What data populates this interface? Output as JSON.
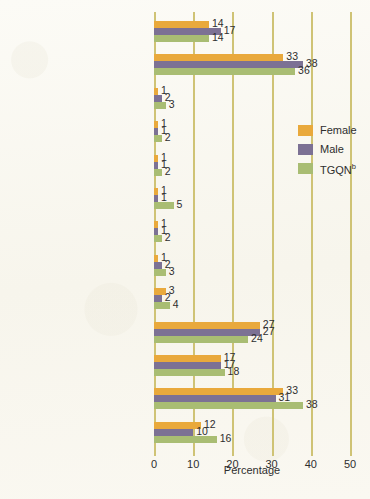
{
  "chart_data": {
    "type": "bar",
    "orientation": "horizontal",
    "title": "",
    "xlabel": "Percentage",
    "ylabel": "",
    "xlim": [
      0,
      50
    ],
    "xticks": [
      0,
      10,
      20,
      30,
      40,
      50
    ],
    "grid": true,
    "legend_position": "right",
    "categories": [
      "Someone I was involved or intimate with at the time",
      "Someone I previously had been involved on intimate with",
      "Teacher",
      "Advisor",
      "Someone I was teaching or advising",
      "Live-in residential staff",
      "Coach or trainer",
      "Boss or supervisor",
      "Co-worker",
      "Friend",
      "Classmate",
      "Someone I know or recognize, but was not a friend",
      "Did not know or recognize this person"
    ],
    "category_lines": [
      [
        "Someone I was involved or",
        "intimate with at the time",
        "a"
      ],
      [
        "Someone I previously had",
        "been involved on intimate with",
        ""
      ],
      [
        "Teacher",
        "",
        ""
      ],
      [
        "Advisor",
        "",
        ""
      ],
      [
        "Someone I was teaching",
        "or advising",
        ""
      ],
      [
        "Live-in residential staff",
        "",
        ""
      ],
      [
        "Coach or trainer",
        "",
        ""
      ],
      [
        "Boss or supervisor",
        "",
        ""
      ],
      [
        "Co-worker",
        "",
        ""
      ],
      [
        "Friend",
        "",
        ""
      ],
      [
        "Classmate",
        "",
        ""
      ],
      [
        "Someone I know or recognize,",
        "but was not a friend",
        ""
      ],
      [
        "Did not know or",
        "recognize this person",
        ""
      ]
    ],
    "series": [
      {
        "name": "Female",
        "color": "#e9a93c",
        "values": [
          14,
          33,
          1,
          1,
          1,
          1,
          1,
          1,
          3,
          27,
          17,
          33,
          12
        ]
      },
      {
        "name": "Male",
        "color": "#7c7194",
        "values": [
          17,
          38,
          2,
          1,
          1,
          1,
          1,
          2,
          2,
          27,
          17,
          31,
          10
        ]
      },
      {
        "name": "TGQN",
        "color": "#a9bd73",
        "values": [
          14,
          36,
          3,
          2,
          2,
          5,
          2,
          3,
          4,
          24,
          18,
          38,
          16
        ]
      }
    ]
  },
  "legend": {
    "items": [
      {
        "label": "Female",
        "sup": "",
        "color": "#e9a93c",
        "key": "female"
      },
      {
        "label": "Male",
        "sup": "",
        "color": "#7c7194",
        "key": "male"
      },
      {
        "label": "TGQN",
        "sup": "b",
        "color": "#a9bd73",
        "key": "tgqn"
      }
    ]
  },
  "axis": {
    "title": "Percentage",
    "tick_labels": [
      "0",
      "10",
      "20",
      "30",
      "40",
      "50"
    ]
  },
  "colors": {
    "female": "#e9a93c",
    "male": "#7c7194",
    "tgqn": "#a9bd73",
    "gridline": "#cfc375",
    "background": "#fbfaf5",
    "text": "#2e2e2e"
  }
}
